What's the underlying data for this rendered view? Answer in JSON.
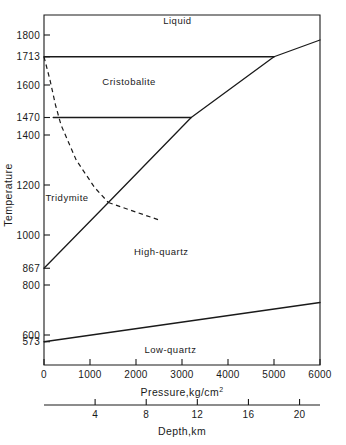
{
  "chart_data": {
    "type": "line",
    "title": "",
    "xlabel": "Pressure,kg/cm2",
    "xlabel_main": "Pressure,kg/cm",
    "xlabel_sup": "2",
    "ylabel": "Temperature",
    "secondary_xlabel": "Depth,km",
    "xlim": [
      0,
      6000
    ],
    "ylim": [
      480,
      1880
    ],
    "grid": false,
    "legend": "none",
    "x_ticks": [
      0,
      1000,
      2000,
      3000,
      4000,
      5000,
      6000
    ],
    "x_tick_labels": [
      "0",
      "1000",
      "2000",
      "3000",
      "4000",
      "5000",
      "6000"
    ],
    "y_ticks": [
      573,
      600,
      800,
      867,
      1000,
      1200,
      1400,
      1470,
      1600,
      1713,
      1800
    ],
    "y_tick_labels": [
      "573",
      "600",
      "800",
      "867",
      "1000",
      "1200",
      "1400",
      "1470",
      "1600",
      "1713",
      "1800"
    ],
    "depth_ticks": [
      4,
      8,
      12,
      16,
      20
    ],
    "depth_tick_labels": [
      "4",
      "8",
      "12",
      "16",
      "20"
    ],
    "depth_lim": [
      0,
      21.6
    ],
    "region_labels": [
      {
        "name": "Liquid",
        "x": 2900,
        "y": 1845
      },
      {
        "name": "Cristobalite",
        "x": 1850,
        "y": 1600
      },
      {
        "name": "Tridymite",
        "x": 500,
        "y": 1135
      },
      {
        "name": "High-quartz",
        "x": 2550,
        "y": 920
      },
      {
        "name": "Low-quartz",
        "x": 2750,
        "y": 530
      }
    ],
    "series": [
      {
        "name": "cristobalite-liquid-melting",
        "style": "solid",
        "points": [
          [
            0,
            1713
          ],
          [
            5000,
            1713
          ]
        ]
      },
      {
        "name": "liquidus-above-5000",
        "style": "solid",
        "points": [
          [
            5000,
            1713
          ],
          [
            6000,
            1780
          ]
        ]
      },
      {
        "name": "tridymite-cristobalite-inversion",
        "style": "solid",
        "points": [
          [
            200,
            1470
          ],
          [
            3200,
            1470
          ]
        ]
      },
      {
        "name": "quartz-tridymite-cristobalite-boundary",
        "style": "solid",
        "points": [
          [
            0,
            867
          ],
          [
            1400,
            1130
          ],
          [
            3200,
            1470
          ],
          [
            5000,
            1713
          ]
        ]
      },
      {
        "name": "metastable-tridymite-boundary",
        "style": "dashed",
        "points": [
          [
            0,
            1713
          ],
          [
            130,
            1620
          ],
          [
            250,
            1520
          ],
          [
            370,
            1440
          ],
          [
            700,
            1300
          ],
          [
            1100,
            1190
          ],
          [
            1400,
            1130
          ]
        ]
      },
      {
        "name": "metastable-branch-lower",
        "style": "dashed",
        "points": [
          [
            1400,
            1130
          ],
          [
            2500,
            1060
          ]
        ]
      },
      {
        "name": "low-high-quartz-inversion",
        "style": "solid",
        "points": [
          [
            0,
            573
          ],
          [
            6000,
            730
          ]
        ]
      }
    ]
  }
}
